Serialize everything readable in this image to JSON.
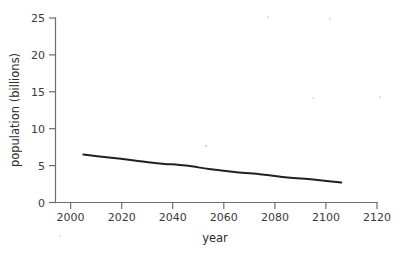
{
  "chart_data": {
    "type": "line",
    "title": "",
    "xlabel": "year",
    "ylabel": "population (billions)",
    "xlim": [
      1995,
      2120
    ],
    "ylim": [
      0,
      25
    ],
    "xticks": [
      2000,
      2020,
      2040,
      2060,
      2080,
      2100,
      2120
    ],
    "xtick_labels": [
      "2000",
      "2020",
      "2040",
      "2060",
      "2080",
      "2100",
      "2120"
    ],
    "yticks": [
      0,
      5,
      10,
      15,
      20,
      25
    ],
    "ytick_labels": [
      "0",
      "5",
      "10",
      "15",
      "20",
      "25"
    ],
    "grid": false,
    "legend": null,
    "series": [
      {
        "name": "population",
        "x": [
          2005,
          2015,
          2025,
          2035,
          2045,
          2055,
          2065,
          2075,
          2085,
          2095,
          2106
        ],
        "values": [
          6.5,
          6.1,
          5.7,
          5.3,
          5.0,
          4.5,
          4.1,
          3.8,
          3.4,
          3.1,
          2.7
        ]
      }
    ]
  },
  "axes": {
    "x_title": "year",
    "y_title": "population (billions)"
  },
  "ticks": {
    "x": [
      {
        "label": "2000",
        "value": 2000
      },
      {
        "label": "2020",
        "value": 2020
      },
      {
        "label": "2040",
        "value": 2040
      },
      {
        "label": "2060",
        "value": 2060
      },
      {
        "label": "2080",
        "value": 2080
      },
      {
        "label": "2100",
        "value": 2100
      },
      {
        "label": "2120",
        "value": 2120
      }
    ],
    "y": [
      {
        "label": "0",
        "value": 0
      },
      {
        "label": "5",
        "value": 5
      },
      {
        "label": "10",
        "value": 10
      },
      {
        "label": "15",
        "value": 15
      },
      {
        "label": "20",
        "value": 20
      },
      {
        "label": "25",
        "value": 25
      }
    ]
  },
  "colors": {
    "line": "#231f20",
    "axis": "#6e6e6e",
    "text": "#3a3a3a",
    "background": "#ffffff"
  }
}
